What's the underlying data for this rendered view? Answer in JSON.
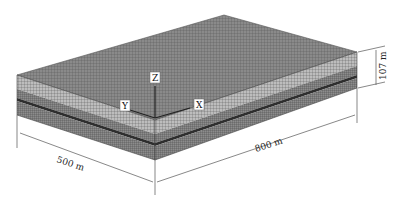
{
  "figure": {
    "dimensions": {
      "length_label": "800 m",
      "width_label": "500 m",
      "height_label": "107 m"
    },
    "axes": {
      "x_label": "X",
      "y_label": "Y",
      "z_label": "Z"
    },
    "colors": {
      "top_surface": "#7a7a7a",
      "upper_layer": "#b4b4b4",
      "middle_layer": "#6e6e6e",
      "dark_band": "#2a2a2a",
      "lower_layer": "#7c7c7c",
      "dimension_line": "#555555"
    }
  }
}
